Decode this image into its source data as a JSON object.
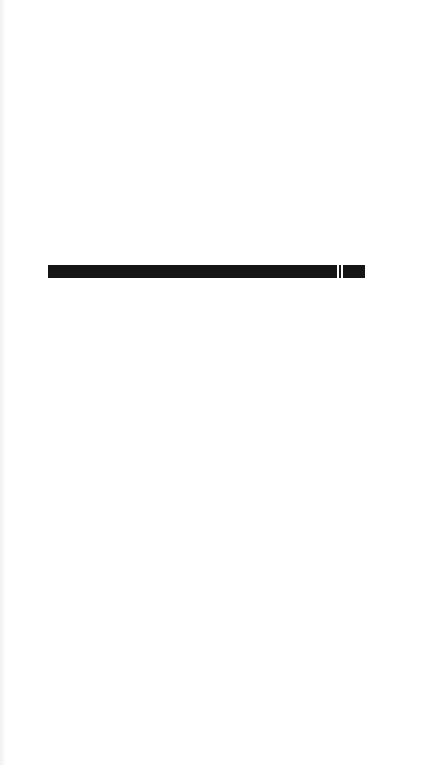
{
  "screen": {
    "background": "#ffffff"
  },
  "progress": {
    "segments": [
      {
        "name": "filled",
        "width_px": 289,
        "color": "#151515"
      },
      {
        "name": "gap",
        "width_px": 2,
        "color": "#ffffff"
      },
      {
        "name": "divider",
        "width_px": 2,
        "color": "#151515"
      },
      {
        "name": "gap",
        "width_px": 2,
        "color": "#ffffff"
      },
      {
        "name": "remaining",
        "width_px": 22,
        "color": "#151515"
      }
    ]
  }
}
